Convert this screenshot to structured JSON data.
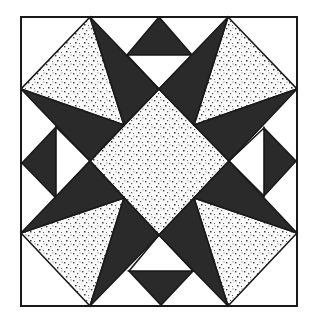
{
  "diagram": {
    "type": "quilt-block",
    "colors": {
      "background": "#ffffff",
      "dark": "#2a2a2a",
      "outline": "#1a1a1a",
      "dot_fabric": "#fafafa",
      "dot": "#444444"
    },
    "frame": {
      "x1": 21,
      "y1": 17,
      "x2": 297,
      "y2": 306
    },
    "pieces": [
      {
        "name": "center-diamond",
        "fill": "dots",
        "points": "159,89 229,161 159,235 90,161"
      },
      {
        "name": "top-edge-triangle",
        "fill": "dark",
        "points": "159,17 127,55 192,55"
      },
      {
        "name": "top-white-triangle",
        "fill": "white",
        "points": "127,55 192,55 159,89"
      },
      {
        "name": "bottom-edge-triangle",
        "fill": "dark",
        "points": "129,271 193,271 161,305"
      },
      {
        "name": "bottom-white-triangle",
        "fill": "white",
        "points": "129,271 193,271 159,235"
      },
      {
        "name": "left-edge-triangle",
        "fill": "dark",
        "points": "22,163 56,127 56,198"
      },
      {
        "name": "left-white-triangle",
        "fill": "white",
        "points": "56,127 56,198 90,161"
      },
      {
        "name": "right-edge-triangle",
        "fill": "dark",
        "points": "296,161 264,128 264,196"
      },
      {
        "name": "right-white-triangle",
        "fill": "white",
        "points": "264,128 264,196 229,161"
      },
      {
        "name": "tl-dotted-triangle",
        "fill": "dots",
        "points": "90,17 21,89 124,125"
      },
      {
        "name": "tl-dark-upper",
        "fill": "dark",
        "points": "90,17 159,89 124,125"
      },
      {
        "name": "tl-dark-lower",
        "fill": "dark",
        "points": "21,89 124,125 90,161"
      },
      {
        "name": "tr-dotted-triangle",
        "fill": "dots",
        "points": "228,17 297,89 194,125"
      },
      {
        "name": "tr-dark-upper",
        "fill": "dark",
        "points": "228,17 159,89 194,125"
      },
      {
        "name": "tr-dark-lower",
        "fill": "dark",
        "points": "297,89 194,125 229,161"
      },
      {
        "name": "bl-dotted-triangle",
        "fill": "dots",
        "points": "21,233 90,306 124,198"
      },
      {
        "name": "bl-dark-upper",
        "fill": "dark",
        "points": "21,233 90,161 124,198"
      },
      {
        "name": "bl-dark-lower",
        "fill": "dark",
        "points": "90,306 124,198 159,235"
      },
      {
        "name": "br-dotted-triangle",
        "fill": "dots",
        "points": "297,233 228,306 194,198"
      },
      {
        "name": "br-dark-upper",
        "fill": "dark",
        "points": "297,233 229,161 194,198"
      },
      {
        "name": "br-dark-lower",
        "fill": "dark",
        "points": "228,306 194,198 159,235"
      }
    ]
  }
}
